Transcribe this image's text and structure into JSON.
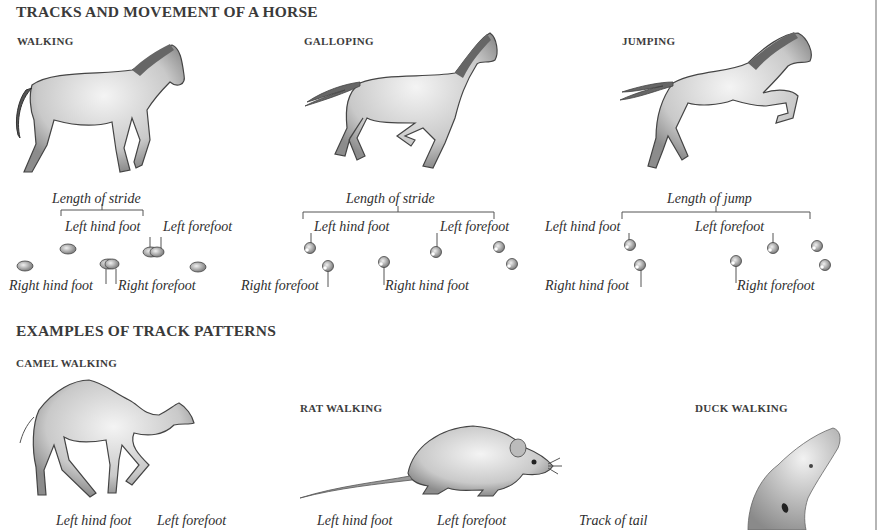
{
  "page": {
    "section1_title": "TRACKS AND MOVEMENT OF A HORSE",
    "section2_title": "EXAMPLES OF TRACK PATTERNS"
  },
  "horse": {
    "walking": {
      "title": "WALKING",
      "measure_label": "Length of stride",
      "labels": {
        "left_hind": "Left hind foot",
        "left_fore": "Left forefoot",
        "right_hind": "Right hind foot",
        "right_fore": "Right forefoot"
      }
    },
    "galloping": {
      "title": "GALLOPING",
      "measure_label": "Length of stride",
      "labels": {
        "left_hind": "Left hind foot",
        "left_fore": "Left forefoot",
        "right_fore": "Right forefoot",
        "right_hind": "Right hind foot"
      }
    },
    "jumping": {
      "title": "JUMPING",
      "measure_label": "Length of jump",
      "labels": {
        "left_hind": "Left hind foot",
        "left_fore": "Left forefoot",
        "right_hind": "Right hind foot",
        "right_fore": "Right forefoot"
      }
    }
  },
  "examples": {
    "camel": {
      "title": "CAMEL WALKING",
      "labels": {
        "left_hind": "Left hind foot",
        "left_fore": "Left forefoot"
      }
    },
    "rat": {
      "title": "RAT WALKING",
      "labels": {
        "left_hind": "Left hind foot",
        "left_fore": "Left forefoot",
        "tail": "Track of tail"
      }
    },
    "duck": {
      "title": "DUCK WALKING"
    }
  },
  "colors": {
    "background": "#ffffff",
    "heading": "#3a3a3a",
    "label": "#2e2e2e",
    "line": "#555555",
    "border": "#b5b5b5"
  }
}
